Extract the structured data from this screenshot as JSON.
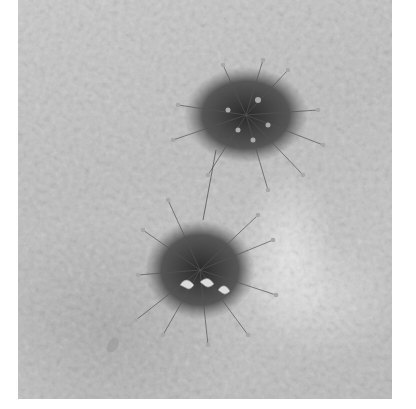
{
  "image": {
    "description": "Grayscale photograph of two tufted flowering plant clusters growing on a textured white sand/stucco surface",
    "subjects": [
      "upper-plant-cluster",
      "lower-plant-cluster"
    ],
    "colors": {
      "background": "#ffffff",
      "surface": "#c4c4c4",
      "highlight": "#e8e8e8",
      "plant_dark": "#2e2e2e",
      "flower_head": "#9a9a9a"
    }
  }
}
